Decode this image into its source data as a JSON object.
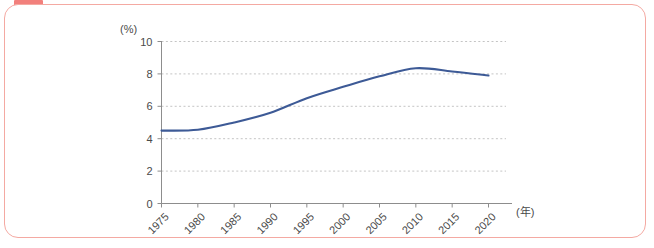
{
  "card": {
    "tab_color": "#f2807c",
    "border_color": "#f4a9a2",
    "background": "#ffffff"
  },
  "chart_data": {
    "type": "line",
    "title": "",
    "subtitle": "",
    "xlabel": "(年)",
    "ylabel": "(%)",
    "categories": [
      "1975",
      "1980",
      "1985",
      "1990",
      "1995",
      "2000",
      "2005",
      "2010",
      "2015",
      "2020"
    ],
    "x": [
      1975,
      1980,
      1985,
      1990,
      1995,
      2000,
      2005,
      2010,
      2015,
      2020
    ],
    "values": [
      4.5,
      4.55,
      5.0,
      5.6,
      6.5,
      7.2,
      7.85,
      8.35,
      8.15,
      7.9
    ],
    "series": [
      {
        "name": "",
        "color": "#3d5a96",
        "values": [
          4.5,
          4.55,
          5.0,
          5.6,
          6.5,
          7.2,
          7.85,
          8.35,
          8.15,
          7.9
        ]
      }
    ],
    "ylim": [
      0,
      10
    ],
    "ytick_values": [
      0,
      2,
      4,
      6,
      8,
      10
    ],
    "ytick_labels": [
      "0",
      "2",
      "4",
      "6",
      "8",
      "10"
    ],
    "xtick_labels": [
      "1975",
      "1980",
      "1985",
      "1990",
      "1995",
      "2000",
      "2005",
      "2010",
      "2015",
      "2020"
    ],
    "grid": true,
    "grid_axis": "y",
    "legend": false,
    "legend_position": "none",
    "line_color": "#3d5a96",
    "grid_color": "#bdbdbd",
    "axis_color": "#8d8d8d",
    "annotations": []
  }
}
